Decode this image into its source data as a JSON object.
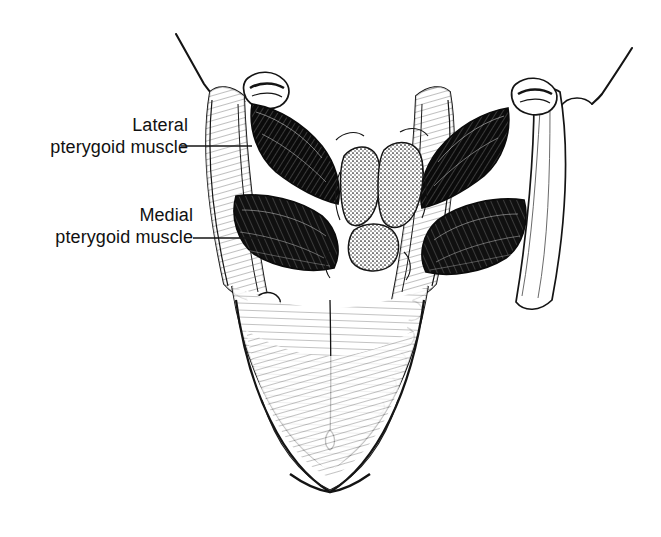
{
  "figure": {
    "kind": "anatomical-line-drawing",
    "background_color": "#ffffff",
    "ink_color": "#111111",
    "width": 661,
    "height": 537
  },
  "labels": [
    {
      "id": "lateral",
      "name": "lateral-pterygoid-muscle-label",
      "line1": "Lateral",
      "line2": "pterygoid muscle",
      "leader": {
        "x1": 181,
        "y1": 146,
        "x2": 252,
        "y2": 146
      }
    },
    {
      "id": "medial",
      "name": "medial-pterygoid-muscle-label",
      "line1": "Medial",
      "line2": "pterygoid muscle",
      "leader": {
        "x1": 193,
        "y1": 238,
        "x2": 266,
        "y2": 238
      }
    }
  ],
  "structures": [
    {
      "name": "left-coronoid-process",
      "side": "left"
    },
    {
      "name": "right-coronoid-process",
      "side": "right"
    },
    {
      "name": "left-condyle",
      "side": "left"
    },
    {
      "name": "right-condyle",
      "side": "right"
    },
    {
      "name": "left-ramus",
      "side": "left"
    },
    {
      "name": "right-ramus",
      "side": "right"
    },
    {
      "name": "left-lateral-pterygoid-muscle",
      "side": "left",
      "shading": "dense-dark-hatch"
    },
    {
      "name": "right-lateral-pterygoid-muscle",
      "side": "right",
      "shading": "dense-dark-hatch"
    },
    {
      "name": "left-medial-pterygoid-muscle",
      "side": "left",
      "shading": "dense-dark-hatch"
    },
    {
      "name": "right-medial-pterygoid-muscle",
      "side": "right",
      "shading": "dense-dark-hatch"
    },
    {
      "name": "cervical-vertebrae",
      "side": "center",
      "shading": "stipple"
    },
    {
      "name": "mandibular-dental-arch",
      "side": "center"
    },
    {
      "name": "mandible-body",
      "side": "center",
      "shading": "fine-line-hatch"
    },
    {
      "name": "mental-symphysis",
      "side": "center"
    }
  ]
}
